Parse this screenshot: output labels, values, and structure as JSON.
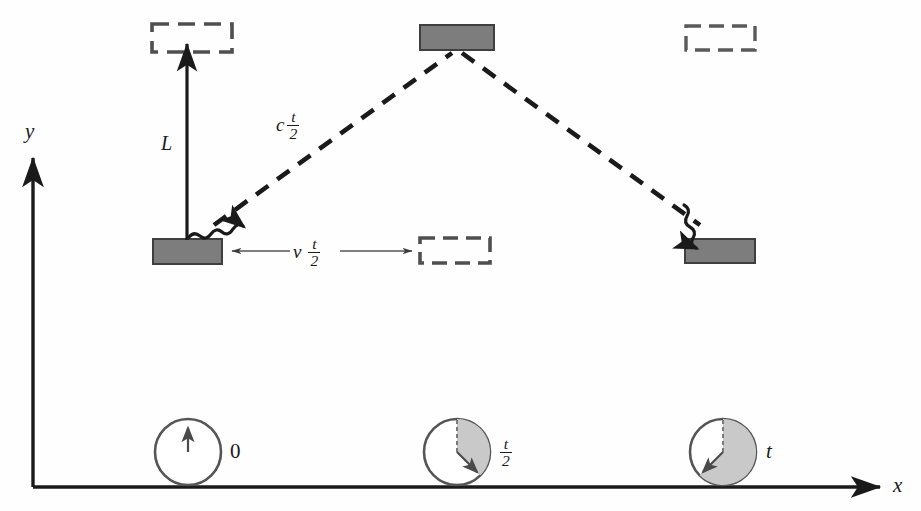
{
  "figure": {
    "axes": {
      "x_label": "x",
      "y_label": "y",
      "origin_x": 33,
      "origin_y": 487,
      "x_axis_end": 888,
      "y_axis_top": 150
    },
    "colors": {
      "ink": "#1a1a1a",
      "mirror_fill": "#7d7d7d",
      "mirror_stroke": "#4a4a4a",
      "clock_stroke": "#555555",
      "clock_shade": "#c9c9c9",
      "thin_line": "#6b6b6b",
      "background": "#fefefe"
    },
    "labels": {
      "height_L": "L",
      "light_path": {
        "lead": "c",
        "numerator": "t",
        "denominator": "2"
      },
      "displacement": {
        "lead": "v",
        "numerator": "t",
        "denominator": "2"
      },
      "clock_0": "0",
      "clock_half": {
        "numerator": "t",
        "denominator": "2"
      },
      "clock_full": "t"
    },
    "mirrors": [
      {
        "name": "top-middle-mirror",
        "style": "solid",
        "x": 420,
        "y": 25,
        "w": 74,
        "h": 25
      },
      {
        "name": "bottom-left-mirror",
        "style": "solid",
        "x": 153,
        "y": 239,
        "w": 69,
        "h": 25
      },
      {
        "name": "bottom-right-mirror",
        "style": "solid",
        "x": 685,
        "y": 239,
        "w": 70,
        "h": 24
      }
    ],
    "ghost_mirrors": [
      {
        "name": "top-left-ghost-mirror",
        "style": "dashed",
        "x": 152,
        "y": 24,
        "w": 80,
        "h": 28
      },
      {
        "name": "top-right-ghost-mirror",
        "style": "dashed",
        "x": 686,
        "y": 26,
        "w": 69,
        "h": 24
      },
      {
        "name": "bottom-middle-ghost-mirror",
        "style": "dashed",
        "x": 420,
        "y": 238,
        "w": 70,
        "h": 25
      }
    ],
    "clocks": [
      {
        "name": "clock-start",
        "cx": 188,
        "cy": 452,
        "r": 33,
        "sweep_deg": 0,
        "hand_deg": 0,
        "label": "0"
      },
      {
        "name": "clock-half",
        "cx": 457,
        "cy": 452,
        "r": 33,
        "sweep_deg": 135,
        "hand_deg": 135,
        "label": "t/2"
      },
      {
        "name": "clock-end",
        "cx": 723,
        "cy": 452,
        "r": 33,
        "sweep_deg": 225,
        "hand_deg": 225,
        "label": "t"
      }
    ],
    "light_path_points": [
      {
        "x": 190,
        "y": 240
      },
      {
        "x": 457,
        "y": 52
      },
      {
        "x": 723,
        "y": 240
      }
    ]
  }
}
